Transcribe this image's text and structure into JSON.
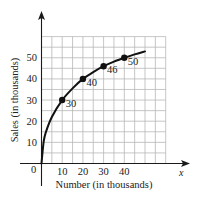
{
  "chart_data": {
    "type": "line",
    "title": "",
    "xlabel": "Number (in thousands)",
    "ylabel": "Sales (in thousands)",
    "x_axis_variable": "x",
    "origin_label": "0",
    "x_ticks": [
      10,
      20,
      30,
      40
    ],
    "y_ticks": [
      10,
      20,
      30,
      40,
      50
    ],
    "xlim": [
      0,
      60
    ],
    "ylim": [
      0,
      60
    ],
    "grid": true,
    "grid_step": 5,
    "legend": "none",
    "series": [
      {
        "name": "Sales",
        "x": [
          10,
          20,
          30,
          40
        ],
        "y": [
          30,
          40,
          46,
          50
        ],
        "point_labels": [
          "30",
          "40",
          "46",
          "50"
        ]
      }
    ],
    "curve_shape": [
      [
        0,
        0
      ],
      [
        1,
        10
      ],
      [
        2,
        14.5
      ],
      [
        5,
        22
      ],
      [
        10,
        30
      ],
      [
        15,
        35.5
      ],
      [
        20,
        40
      ],
      [
        25,
        43.2
      ],
      [
        30,
        46
      ],
      [
        35,
        48.2
      ],
      [
        40,
        50
      ],
      [
        45,
        51.6
      ],
      [
        50,
        53
      ]
    ],
    "colors": {
      "curve": "#111111",
      "grid": "#b8b8b8",
      "axis": "#1a1a1a"
    }
  }
}
